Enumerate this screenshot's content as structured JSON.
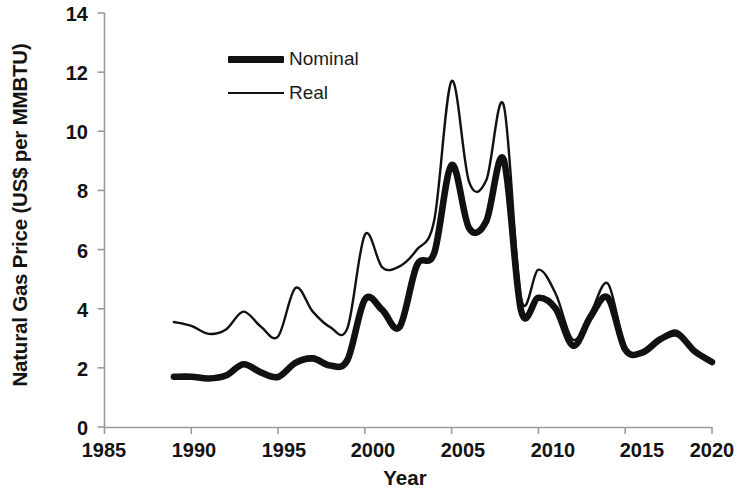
{
  "chart_data": {
    "type": "line",
    "title": "",
    "xlabel": "Year",
    "ylabel": "Natural Gas Price (US$ per MMBTU)",
    "xlim": [
      1985,
      2020
    ],
    "ylim": [
      0,
      14
    ],
    "x_ticks": [
      "1985",
      "1990",
      "1995",
      "2000",
      "2005",
      "2010",
      "2015",
      "2020"
    ],
    "y_ticks": [
      "0",
      "2",
      "4",
      "6",
      "8",
      "10",
      "12",
      "14"
    ],
    "grid": false,
    "legend_position": "top-center",
    "x": [
      1989,
      1990,
      1991,
      1992,
      1993,
      1994,
      1995,
      1996,
      1997,
      1998,
      1999,
      2000,
      2001,
      2002,
      2003,
      2004,
      2005,
      2006,
      2007,
      2008,
      2009,
      2010,
      2011,
      2012,
      2013,
      2014,
      2015,
      2016,
      2017,
      2018,
      2019,
      2020
    ],
    "series": [
      {
        "name": "Nominal",
        "style": "thick",
        "values": [
          1.7,
          1.7,
          1.64,
          1.74,
          2.12,
          1.85,
          1.69,
          2.17,
          2.32,
          2.08,
          2.27,
          4.31,
          3.96,
          3.38,
          5.47,
          5.89,
          8.86,
          6.73,
          6.97,
          9.04,
          3.94,
          4.37,
          4.0,
          2.75,
          3.73,
          4.37,
          2.62,
          2.52,
          2.96,
          3.15,
          2.56,
          2.2
        ]
      },
      {
        "name": "Real",
        "style": "thin",
        "values": [
          3.55,
          3.42,
          3.15,
          3.3,
          3.9,
          3.4,
          3.06,
          4.7,
          3.9,
          3.38,
          3.35,
          6.5,
          5.4,
          5.43,
          6.0,
          7.0,
          11.7,
          8.3,
          8.35,
          10.88,
          4.35,
          5.32,
          4.5,
          2.95,
          3.85,
          4.85,
          2.72,
          2.58,
          3.0,
          3.25,
          2.6,
          2.2
        ]
      }
    ],
    "axis_color": "#999999",
    "line_color": "#111111"
  },
  "legend": {
    "items": [
      {
        "label": "Nominal"
      },
      {
        "label": "Real"
      }
    ]
  }
}
